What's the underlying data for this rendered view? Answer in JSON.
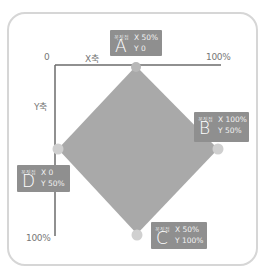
{
  "axes": {
    "origin_label": "0",
    "x_axis_label": "X축",
    "y_axis_label": "Y축",
    "x_max_label": "100%",
    "y_max_label": "100%"
  },
  "colors": {
    "shape_fill": "#a9a9a9",
    "vertex_dot": "#c4c4c4",
    "label_bg": "#8f8f8f",
    "axis_line": "#6b6b6b",
    "frame_border": "#d6d6d6"
  },
  "vertices": [
    {
      "id": "A",
      "tag": "꼭짓점",
      "letter": "A",
      "x_label": "X 50%",
      "y_label": "Y 0"
    },
    {
      "id": "B",
      "tag": "꼭짓점",
      "letter": "B",
      "x_label": "X 100%",
      "y_label": "Y 50%"
    },
    {
      "id": "C",
      "tag": "꼭짓점",
      "letter": "C",
      "x_label": "X 50%",
      "y_label": "Y 100%"
    },
    {
      "id": "D",
      "tag": "꼭짓점",
      "letter": "D",
      "x_label": "X 0",
      "y_label": "Y 50%"
    }
  ]
}
